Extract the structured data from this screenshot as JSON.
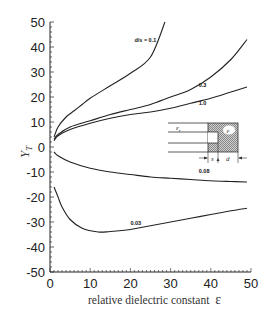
{
  "chart_data": {
    "type": "line",
    "title": "",
    "xlabel": "relative dielectric constant",
    "xlabel_symbol": "ε",
    "ylabel": "Y_T",
    "xlim": [
      0,
      50
    ],
    "ylim": [
      -50,
      50
    ],
    "x_ticks": [
      0,
      10,
      20,
      30,
      40,
      50
    ],
    "y_ticks": [
      50,
      40,
      30,
      20,
      10,
      0,
      -10,
      -20,
      -30,
      -40,
      -50
    ],
    "grid": false,
    "legend": "inline labels on curves",
    "series_label_prefix": "d/s =",
    "series": [
      {
        "name": "0.1",
        "label": "d/s = 0.1",
        "x": [
          1,
          2,
          4,
          6,
          8,
          10,
          15,
          20,
          25,
          28.6
        ],
        "y": [
          4,
          8,
          12,
          14.5,
          17,
          19.5,
          24.5,
          29.5,
          36,
          50
        ]
      },
      {
        "name": "0.3",
        "label": "0.3",
        "x": [
          1,
          2,
          5,
          10,
          15,
          20,
          25,
          30,
          35,
          40,
          45,
          49
        ],
        "y": [
          3,
          5,
          8,
          10.5,
          13,
          15,
          17,
          20,
          23,
          28,
          35,
          43
        ]
      },
      {
        "name": "1.0",
        "label": "1.0",
        "x": [
          1,
          2,
          5,
          10,
          15,
          20,
          25,
          30,
          35,
          40,
          45,
          49
        ],
        "y": [
          2.5,
          4.5,
          7,
          9.5,
          11.5,
          13,
          14,
          15.5,
          17.5,
          19.5,
          22,
          24
        ]
      },
      {
        "name": "0.08",
        "label": "0.08",
        "x": [
          1,
          2,
          5,
          10,
          15,
          20,
          25,
          30,
          35,
          40,
          45,
          49
        ],
        "y": [
          -2,
          -3.5,
          -6,
          -8.5,
          -10,
          -11,
          -12,
          -12.5,
          -13,
          -13.5,
          -13.8,
          -14
        ]
      },
      {
        "name": "0.03",
        "label": "0.03",
        "x": [
          1,
          2,
          3,
          5,
          8,
          12,
          15,
          20,
          25,
          30,
          35,
          40,
          45,
          49
        ],
        "y": [
          -16,
          -20,
          -24,
          -29,
          -32.5,
          -34,
          -33.8,
          -33,
          -31.5,
          -30,
          -28.5,
          -27,
          -25.5,
          -24.5
        ]
      }
    ],
    "annotations": [
      {
        "text": "d/s = 0.1",
        "x": 21,
        "y": 42
      },
      {
        "text": "0.3",
        "x": 37,
        "y": 24
      },
      {
        "text": "1.0",
        "x": 37,
        "y": 17
      },
      {
        "text": "0.08",
        "x": 37,
        "y": -10.5
      },
      {
        "text": "0.03",
        "x": 20,
        "y": -31
      }
    ],
    "inset": {
      "description": "cross-section: parallel lines of dielectric ε_r meeting a hatched block of dielectric ε; gap s and width d dimensioned",
      "labels": {
        "eps_r": "ε",
        "eps_r_sub": "r",
        "eps": "ε",
        "s": "s",
        "d": "d"
      }
    }
  }
}
